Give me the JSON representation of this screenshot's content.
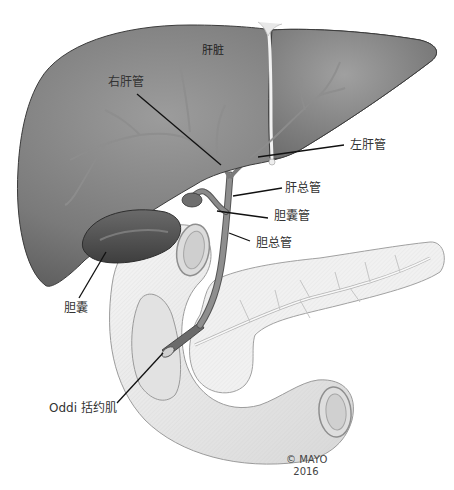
{
  "diagram": {
    "colors": {
      "liver": "#7a7a7a",
      "liver_highlight": "#9a9a9a",
      "liver_shadow": "#4f4f4f",
      "duct": "#8a8a8a",
      "duodenum": "#ebebeb",
      "pancreas": "#f1f1f1",
      "leader_line": "#111111",
      "text": "#333333"
    },
    "labels": {
      "liver": "肝脏",
      "right_hepatic_duct": "右肝管",
      "left_hepatic_duct": "左肝管",
      "common_hepatic_duct": "肝总管",
      "cystic_duct": "胆囊管",
      "common_bile_duct": "胆总管",
      "gallbladder": "胆囊",
      "sphincter_of_oddi": "Oddi 括约肌"
    },
    "copyright": {
      "line1": "© MAYO",
      "line2": "2016"
    }
  }
}
